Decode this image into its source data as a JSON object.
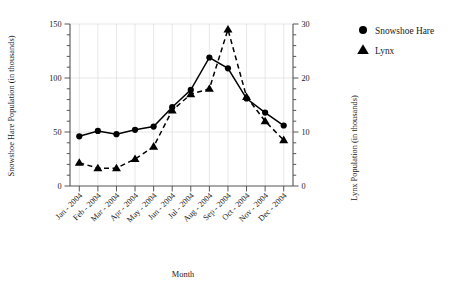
{
  "chart_data": {
    "type": "line",
    "title": "",
    "xlabel": "Month",
    "ylabel": "Snowshoe Hare Population (in thousands)",
    "y2label": "Lynx Population (in thousands)",
    "categories": [
      "Jan - 2004",
      "Feb - 2004",
      "Mar - 2004",
      "Apr - 2004",
      "May - 2004",
      "Jun - 2004",
      "Jul - 2004",
      "Aug - 2004",
      "Sep - 2004",
      "Oct - 2004",
      "Nov - 2004",
      "Dec - 2004"
    ],
    "ylim": [
      0,
      150
    ],
    "yticks": [
      0,
      50,
      100,
      150
    ],
    "ytick_labels": [
      "0",
      "50",
      "100",
      "150"
    ],
    "y2lim": [
      0,
      30
    ],
    "y2ticks": [
      0,
      10,
      20,
      30
    ],
    "y2tick_labels": [
      "0",
      "10",
      "20",
      "30"
    ],
    "grid": true,
    "legend_position": "right",
    "series": [
      {
        "name": "Snowshoe Hare",
        "axis": "left",
        "marker": "circle",
        "line_style": "solid",
        "color": "#000000",
        "values": [
          46,
          51,
          48,
          52,
          55,
          73,
          89,
          119,
          109,
          81,
          68,
          56
        ]
      },
      {
        "name": "Lynx",
        "axis": "right",
        "marker": "triangle",
        "line_style": "dashed",
        "color": "#000000",
        "values": [
          4.3,
          3.3,
          3.3,
          5.0,
          7.3,
          14.0,
          17.0,
          18.0,
          29.0,
          16.5,
          12.0,
          8.5
        ]
      }
    ]
  },
  "legend": {
    "items": [
      {
        "label": "Snowshoe Hare",
        "marker": "circle"
      },
      {
        "label": "Lynx",
        "marker": "triangle"
      }
    ]
  },
  "colors": {
    "ink": "#000000",
    "grid": "#dcdcdc",
    "axis": "#555555",
    "background": "#ffffff"
  }
}
